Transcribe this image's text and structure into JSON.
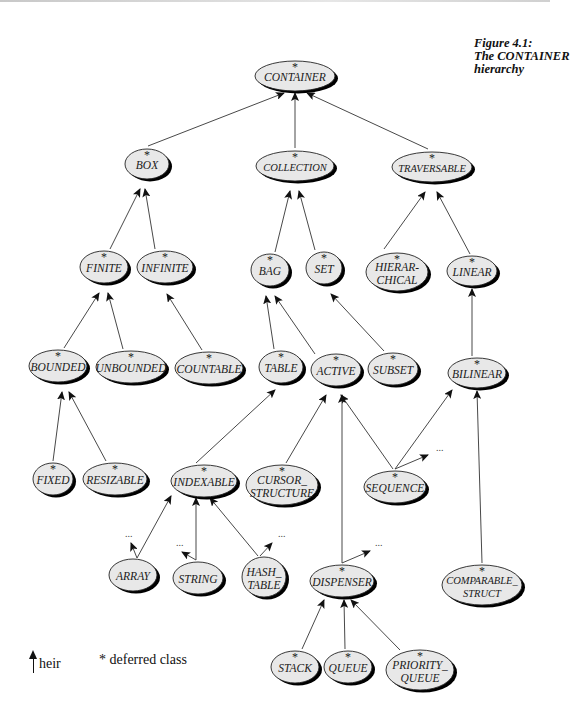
{
  "caption": {
    "line1": "Figure 4.1:",
    "line2": "The CONTAINER",
    "line3": "hierarchy"
  },
  "legend": {
    "heir_label": "heir",
    "deferred_label": "* deferred class"
  },
  "deferred_marker": "*",
  "ellipsis": "...",
  "nodes": [
    {
      "id": "CONTAINER",
      "lines": [
        "CONTAINER"
      ],
      "x": 295,
      "y": 76,
      "rx": 40,
      "ry": 15,
      "deferred": true
    },
    {
      "id": "BOX",
      "lines": [
        "BOX"
      ],
      "x": 147,
      "y": 164,
      "rx": 22,
      "ry": 15,
      "deferred": true
    },
    {
      "id": "COLLECTION",
      "lines": [
        "COLLECTION"
      ],
      "x": 295,
      "y": 166,
      "rx": 39,
      "ry": 15,
      "deferred": true
    },
    {
      "id": "TRAVERSABLE",
      "lines": [
        "TRAVERSABLE"
      ],
      "x": 432,
      "y": 167,
      "rx": 40,
      "ry": 15,
      "deferred": true
    },
    {
      "id": "FINITE",
      "lines": [
        "FINITE"
      ],
      "x": 104,
      "y": 267,
      "rx": 24,
      "ry": 16,
      "deferred": true
    },
    {
      "id": "INFINITE",
      "lines": [
        "INFINITE"
      ],
      "x": 165,
      "y": 267,
      "rx": 28,
      "ry": 16,
      "deferred": true
    },
    {
      "id": "BAG",
      "lines": [
        "BAG"
      ],
      "x": 270,
      "y": 270,
      "rx": 19,
      "ry": 16,
      "deferred": true
    },
    {
      "id": "SET",
      "lines": [
        "SET"
      ],
      "x": 324,
      "y": 268,
      "rx": 18,
      "ry": 16,
      "deferred": true
    },
    {
      "id": "HIERARCHICAL",
      "lines": [
        "HIERAR-",
        "CHICAL"
      ],
      "x": 397,
      "y": 272,
      "rx": 31,
      "ry": 19,
      "deferred": true
    },
    {
      "id": "LINEAR",
      "lines": [
        "LINEAR"
      ],
      "x": 472,
      "y": 271,
      "rx": 25,
      "ry": 15,
      "deferred": true
    },
    {
      "id": "BOUNDED",
      "lines": [
        "BOUNDED"
      ],
      "x": 58,
      "y": 366,
      "rx": 29,
      "ry": 16,
      "deferred": true
    },
    {
      "id": "UNBOUNDED",
      "lines": [
        "UNBOUNDED"
      ],
      "x": 131,
      "y": 367,
      "rx": 35,
      "ry": 16,
      "deferred": true
    },
    {
      "id": "COUNTABLE",
      "lines": [
        "COUNTABLE"
      ],
      "x": 209,
      "y": 368,
      "rx": 34,
      "ry": 16,
      "deferred": true
    },
    {
      "id": "TABLE",
      "lines": [
        "TABLE"
      ],
      "x": 281,
      "y": 367,
      "rx": 22,
      "ry": 16,
      "deferred": true
    },
    {
      "id": "ACTIVE",
      "lines": [
        "ACTIVE"
      ],
      "x": 336,
      "y": 370,
      "rx": 25,
      "ry": 16,
      "deferred": true
    },
    {
      "id": "SUBSET",
      "lines": [
        "SUBSET"
      ],
      "x": 393,
      "y": 369,
      "rx": 25,
      "ry": 16,
      "deferred": true
    },
    {
      "id": "BILINEAR",
      "lines": [
        "BILINEAR"
      ],
      "x": 477,
      "y": 373,
      "rx": 29,
      "ry": 15,
      "deferred": true
    },
    {
      "id": "FIXED",
      "lines": [
        "FIXED"
      ],
      "x": 53,
      "y": 479,
      "rx": 20,
      "ry": 16,
      "deferred": true
    },
    {
      "id": "RESIZABLE",
      "lines": [
        "RESIZABLE"
      ],
      "x": 115,
      "y": 479,
      "rx": 32,
      "ry": 16,
      "deferred": true
    },
    {
      "id": "INDEXABLE",
      "lines": [
        "INDEXABLE"
      ],
      "x": 204,
      "y": 481,
      "rx": 33,
      "ry": 16,
      "deferred": true
    },
    {
      "id": "CURSOR_STRUCTURE",
      "lines": [
        "CURSOR_",
        "STRUCTURE"
      ],
      "x": 282,
      "y": 485,
      "rx": 36,
      "ry": 20,
      "deferred": true
    },
    {
      "id": "SEQUENCE",
      "lines": [
        "SEQUENCE"
      ],
      "x": 395,
      "y": 487,
      "rx": 31,
      "ry": 16,
      "deferred": true
    },
    {
      "id": "ARRAY",
      "lines": [
        "ARRAY"
      ],
      "x": 133,
      "y": 575,
      "rx": 24,
      "ry": 16,
      "deferred": false
    },
    {
      "id": "STRING",
      "lines": [
        "STRING"
      ],
      "x": 198,
      "y": 578,
      "rx": 25,
      "ry": 16,
      "deferred": false
    },
    {
      "id": "HASH_TABLE",
      "lines": [
        "HASH_",
        "TABLE"
      ],
      "x": 264,
      "y": 577,
      "rx": 22,
      "ry": 20,
      "deferred": false
    },
    {
      "id": "DISPENSER",
      "lines": [
        "DISPENSER"
      ],
      "x": 342,
      "y": 581,
      "rx": 32,
      "ry": 16,
      "deferred": true
    },
    {
      "id": "COMPARABLE_STRUCT",
      "lines": [
        "COMPARABLE_",
        "STRUCT"
      ],
      "x": 482,
      "y": 585,
      "rx": 40,
      "ry": 20,
      "deferred": true
    },
    {
      "id": "STACK",
      "lines": [
        "STACK"
      ],
      "x": 295,
      "y": 667,
      "rx": 24,
      "ry": 16,
      "deferred": true
    },
    {
      "id": "QUEUE",
      "lines": [
        "QUEUE"
      ],
      "x": 348,
      "y": 667,
      "rx": 24,
      "ry": 16,
      "deferred": true
    },
    {
      "id": "PRIORITY_QUEUE",
      "lines": [
        "PRIORITY_",
        "QUEUE"
      ],
      "x": 420,
      "y": 670,
      "rx": 34,
      "ry": 20,
      "deferred": true
    }
  ],
  "edges": [
    {
      "from": [
        148,
        146
      ],
      "to": [
        284,
        93
      ]
    },
    {
      "from": [
        295,
        148
      ],
      "to": [
        295,
        93
      ]
    },
    {
      "from": [
        428,
        149
      ],
      "to": [
        307,
        93
      ]
    },
    {
      "from": [
        110,
        249
      ],
      "to": [
        140,
        189
      ]
    },
    {
      "from": [
        155,
        249
      ],
      "to": [
        145,
        189
      ]
    },
    {
      "from": [
        275,
        252
      ],
      "to": [
        290,
        191
      ]
    },
    {
      "from": [
        315,
        250
      ],
      "to": [
        299,
        191
      ]
    },
    {
      "from": [
        384,
        249
      ],
      "to": [
        425,
        192
      ]
    },
    {
      "from": [
        470,
        254
      ],
      "to": [
        437,
        192
      ]
    },
    {
      "from": [
        64,
        348
      ],
      "to": [
        99,
        293
      ]
    },
    {
      "from": [
        123,
        349
      ],
      "to": [
        108,
        293
      ]
    },
    {
      "from": [
        202,
        350
      ],
      "to": [
        167,
        294
      ]
    },
    {
      "from": [
        274,
        349
      ],
      "to": [
        266,
        296
      ]
    },
    {
      "from": [
        315,
        354
      ],
      "to": [
        275,
        296
      ]
    },
    {
      "from": [
        384,
        351
      ],
      "to": [
        331,
        294
      ]
    },
    {
      "from": [
        472,
        356
      ],
      "to": [
        472,
        289
      ]
    },
    {
      "from": [
        53,
        461
      ],
      "to": [
        62,
        392
      ]
    },
    {
      "from": [
        106,
        461
      ],
      "to": [
        69,
        392
      ]
    },
    {
      "from": [
        196,
        463
      ],
      "to": [
        275,
        390
      ]
    },
    {
      "from": [
        286,
        463
      ],
      "to": [
        326,
        395
      ]
    },
    {
      "from": [
        393,
        469
      ],
      "to": [
        341,
        395
      ]
    },
    {
      "from": [
        395,
        469
      ],
      "to": [
        452,
        390
      ]
    },
    {
      "from": [
        395,
        469
      ],
      "to": [
        428,
        455
      ]
    },
    {
      "from": [
        342,
        563
      ],
      "to": [
        342,
        395
      ]
    },
    {
      "from": [
        482,
        563
      ],
      "to": [
        477,
        391
      ]
    },
    {
      "from": [
        137,
        558
      ],
      "to": [
        171,
        496
      ]
    },
    {
      "from": [
        196,
        560
      ],
      "to": [
        196,
        498
      ]
    },
    {
      "from": [
        258,
        556
      ],
      "to": [
        210,
        498
      ]
    },
    {
      "from": [
        137,
        558
      ],
      "to": [
        131,
        543
      ]
    },
    {
      "from": [
        196,
        560
      ],
      "to": [
        182,
        552
      ]
    },
    {
      "from": [
        260,
        556
      ],
      "to": [
        272,
        543
      ]
    },
    {
      "from": [
        342,
        563
      ],
      "to": [
        370,
        551
      ]
    },
    {
      "from": [
        302,
        649
      ],
      "to": [
        324,
        600
      ]
    },
    {
      "from": [
        345,
        649
      ],
      "to": [
        344,
        600
      ]
    },
    {
      "from": [
        400,
        650
      ],
      "to": [
        351,
        600
      ]
    }
  ],
  "ellipses": [
    {
      "x": 125,
      "y": 537
    },
    {
      "x": 176,
      "y": 546
    },
    {
      "x": 278,
      "y": 537
    },
    {
      "x": 375,
      "y": 546
    },
    {
      "x": 436,
      "y": 451
    }
  ]
}
